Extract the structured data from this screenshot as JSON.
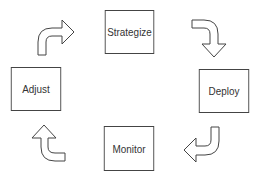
{
  "diagram": {
    "type": "cycle",
    "stages": [
      {
        "label": "Strategize"
      },
      {
        "label": "Deploy"
      },
      {
        "label": "Monitor"
      },
      {
        "label": "Adjust"
      }
    ],
    "arrows": [
      {
        "from": "Strategize",
        "to": "Deploy"
      },
      {
        "from": "Deploy",
        "to": "Monitor"
      },
      {
        "from": "Monitor",
        "to": "Adjust"
      },
      {
        "from": "Adjust",
        "to": "Strategize"
      }
    ],
    "colors": {
      "stroke": "#444444",
      "fill": "#ffffff",
      "text": "#333333"
    }
  }
}
